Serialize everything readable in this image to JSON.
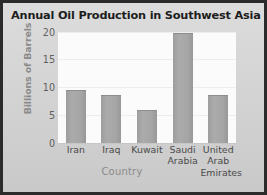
{
  "chart_data": {
    "type": "bar",
    "title": "Annual Oil Production in Southwest Asia",
    "xlabel": "Country",
    "ylabel": "Billions of Barrels",
    "categories": [
      "Iran",
      "Iraq",
      "Kuwait",
      "Saudi Arabia",
      "United Arab Emirates"
    ],
    "category_lines": [
      [
        "Iran"
      ],
      [
        "Iraq"
      ],
      [
        "Kuwait"
      ],
      [
        "Saudi",
        "Arabia"
      ],
      [
        "United",
        "Arab",
        "Emirates"
      ]
    ],
    "values": [
      9.5,
      8.7,
      6.0,
      19.8,
      8.7
    ],
    "ylim": [
      0,
      20
    ],
    "yticks": [
      0,
      5,
      10,
      15,
      20
    ],
    "ytick_labels": [
      "0",
      "5",
      "10",
      "15",
      "20"
    ],
    "grid": true,
    "legend": false,
    "colors": {
      "bar": "#a5a5a5",
      "plot_background": "#fbfbfb",
      "page_background": "#d4d4d4",
      "frame": "#2b2b2b",
      "title_text": "#1d1d1d",
      "axis_label_text": "#8a8a8a",
      "tick_text": "#4a4a4a",
      "gridline": "#ededed"
    }
  }
}
